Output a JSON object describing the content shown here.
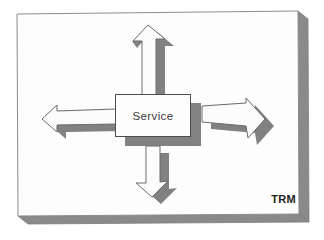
{
  "diagram": {
    "type": "service-hub-diagram",
    "service_label": "Service",
    "trm_label": "TRM",
    "arrows": [
      {
        "direction": "up"
      },
      {
        "direction": "down"
      },
      {
        "direction": "left"
      },
      {
        "direction": "right"
      }
    ]
  },
  "colors": {
    "background": "#ffffff",
    "slab_face": "#fdfdfd",
    "slab_side": "#8a8a8a",
    "shadow": "#818181",
    "arrow_face": "#fcfcfc",
    "box_border": "#4d4d4d",
    "text": "#3a3a3a",
    "trm_text": "#1c1c1c"
  }
}
